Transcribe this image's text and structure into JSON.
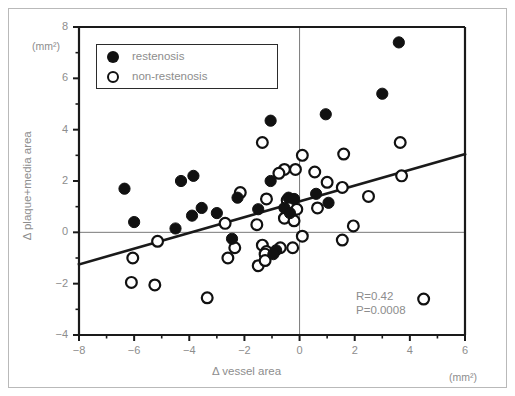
{
  "figure": {
    "type": "scatter-plot"
  },
  "axes": {
    "x": {
      "title": "Δ vessel area",
      "unit": "(mm²)",
      "ticks": [
        -8,
        -6,
        -4,
        -2,
        0,
        2,
        4,
        6
      ],
      "tick_labels": [
        "−8",
        "−6",
        "−4",
        "−2",
        "0",
        "2",
        "4",
        "6"
      ],
      "min": -8,
      "max": 6
    },
    "y": {
      "title": "Δ plaque+media area",
      "unit": "(mm²)",
      "ticks": [
        -4,
        -2,
        0,
        2,
        4,
        6,
        8
      ],
      "tick_labels": [
        "−4",
        "−2",
        "0",
        "2",
        "4",
        "6",
        "8"
      ],
      "min": -4,
      "max": 8
    }
  },
  "legend": {
    "items": [
      {
        "label": "restenosis",
        "marker": "filled-circle",
        "color": "#111111"
      },
      {
        "label": "non-restenosis",
        "marker": "open-circle",
        "color": "#111111"
      }
    ]
  },
  "stats": {
    "r_line": "R=0.42",
    "p_line": "P=0.0008",
    "color": "#8d8d8d"
  },
  "colors": {
    "marker": "#111111",
    "text": "#8d8d8d",
    "axis": "#1a1a1a",
    "reference_line": "#7a7a7a",
    "frame": "#b9b9b9"
  },
  "chart_data": {
    "type": "scatter",
    "title": "",
    "xlabel": "Δ vessel area",
    "ylabel": "Δ plaque+media area",
    "xunit": "mm²",
    "yunit": "mm²",
    "xlim": [
      -8,
      6
    ],
    "ylim": [
      -4,
      8
    ],
    "grid": false,
    "legend_position": "top-left",
    "annotations": [
      "R=0.42",
      "P=0.0008"
    ],
    "reference_lines": [
      {
        "orientation": "horizontal",
        "value": 0
      },
      {
        "orientation": "vertical",
        "value": 0
      }
    ],
    "trendline": {
      "type": "linear-regression",
      "x_start": -8,
      "y_start": -1.25,
      "x_end": 6,
      "y_end": 3.05,
      "slope": 0.307,
      "intercept": 1.21,
      "r": 0.42,
      "p": 0.0008
    },
    "series": [
      {
        "name": "restenosis",
        "marker": "filled-circle",
        "points": [
          [
            3.6,
            7.4
          ],
          [
            3.0,
            5.4
          ],
          [
            0.95,
            4.6
          ],
          [
            -1.05,
            4.35
          ],
          [
            -4.3,
            2.0
          ],
          [
            -3.85,
            2.2
          ],
          [
            -1.05,
            2.0
          ],
          [
            -6.35,
            1.7
          ],
          [
            -2.25,
            1.35
          ],
          [
            0.6,
            1.5
          ],
          [
            -0.4,
            1.35
          ],
          [
            -0.2,
            1.3
          ],
          [
            1.05,
            1.15
          ],
          [
            -3.55,
            0.95
          ],
          [
            -3.0,
            0.75
          ],
          [
            -3.9,
            0.65
          ],
          [
            -6.0,
            0.4
          ],
          [
            -1.5,
            0.9
          ],
          [
            -0.55,
            0.95
          ],
          [
            -0.35,
            0.75
          ],
          [
            -4.5,
            0.15
          ],
          [
            -2.45,
            -0.25
          ],
          [
            -0.85,
            -0.7
          ],
          [
            -0.95,
            -0.85
          ]
        ]
      },
      {
        "name": "non-restenosis",
        "marker": "open-circle",
        "points": [
          [
            3.65,
            3.5
          ],
          [
            -1.35,
            3.5
          ],
          [
            0.1,
            3.0
          ],
          [
            1.6,
            3.05
          ],
          [
            -0.55,
            2.45
          ],
          [
            -0.15,
            2.45
          ],
          [
            -0.75,
            2.3
          ],
          [
            0.55,
            2.35
          ],
          [
            3.7,
            2.2
          ],
          [
            1.0,
            1.95
          ],
          [
            1.55,
            1.75
          ],
          [
            -2.15,
            1.55
          ],
          [
            2.5,
            1.4
          ],
          [
            -1.2,
            1.3
          ],
          [
            -0.45,
            1.25
          ],
          [
            -0.3,
            1.1
          ],
          [
            -0.1,
            0.9
          ],
          [
            0.65,
            0.95
          ],
          [
            -2.7,
            0.35
          ],
          [
            -1.55,
            0.3
          ],
          [
            -0.55,
            0.55
          ],
          [
            -0.2,
            0.45
          ],
          [
            1.95,
            0.25
          ],
          [
            -5.15,
            -0.35
          ],
          [
            -2.35,
            -0.6
          ],
          [
            -1.35,
            -0.5
          ],
          [
            -1.2,
            -0.75
          ],
          [
            -1.25,
            -0.85
          ],
          [
            -0.7,
            -0.6
          ],
          [
            -0.25,
            -0.6
          ],
          [
            0.1,
            -0.15
          ],
          [
            1.55,
            -0.3
          ],
          [
            -6.05,
            -1.0
          ],
          [
            -2.6,
            -1.0
          ],
          [
            -1.5,
            -1.3
          ],
          [
            -1.25,
            -1.1
          ],
          [
            -6.1,
            -1.95
          ],
          [
            -5.25,
            -2.05
          ],
          [
            -3.35,
            -2.55
          ],
          [
            4.5,
            -2.6
          ]
        ]
      }
    ]
  }
}
